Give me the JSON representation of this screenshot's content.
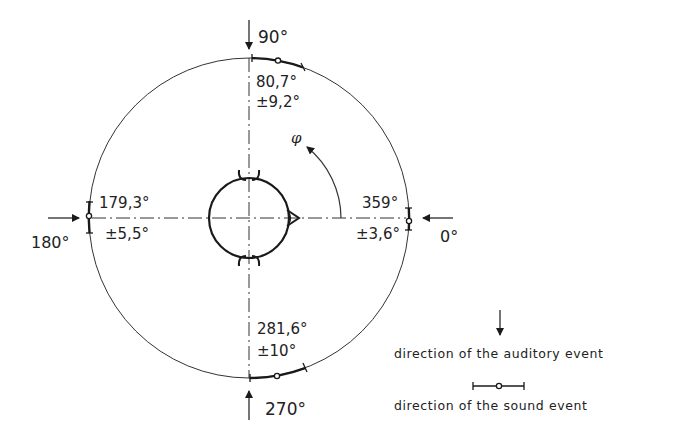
{
  "diagram": {
    "angle_symbol": "φ",
    "directions": [
      {
        "id": "front",
        "sound_event_label": "0°",
        "auditory_event_mean": "359°",
        "auditory_event_spread": "±3,6°"
      },
      {
        "id": "left",
        "sound_event_label": "90°",
        "auditory_event_mean": "80,7°",
        "auditory_event_spread": "±9,2°"
      },
      {
        "id": "rear",
        "sound_event_label": "180°",
        "auditory_event_mean": "179,3°",
        "auditory_event_spread": "±5,5°"
      },
      {
        "id": "right",
        "sound_event_label": "270°",
        "auditory_event_mean": "281,6°",
        "auditory_event_spread": "±10°"
      }
    ],
    "legend": {
      "auditory_event": "direction of the auditory event",
      "sound_event": "direction of the sound event"
    },
    "colors": {
      "line": "#1a1a1a",
      "background": "#ffffff"
    }
  }
}
